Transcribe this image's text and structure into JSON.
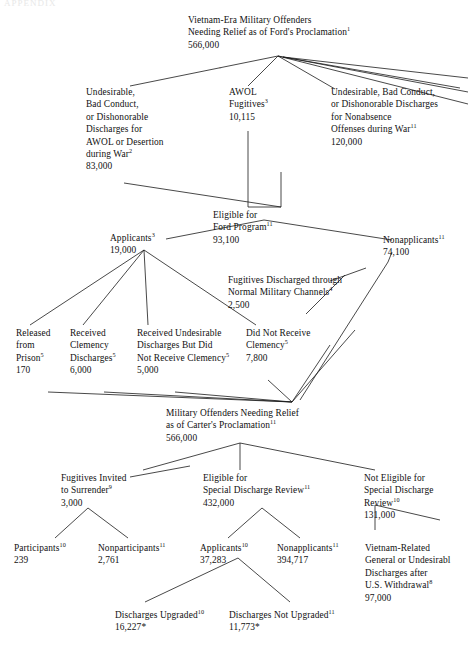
{
  "page": {
    "header_faint": "APPENDIX",
    "background": "#ffffff",
    "ink": "#111111"
  },
  "diagram": {
    "type": "flowchart",
    "nodes": [
      {
        "id": "ford_total",
        "lines": [
          "Vietnam-Era Military Offenders",
          "Needing Relief as of Ford's Proclamation"
        ],
        "sup": "1",
        "value": "566,000"
      },
      {
        "id": "undesirable_awol",
        "lines": [
          "Undesirable,",
          "Bad Conduct,",
          "or Dishonorable",
          "Discharges for",
          "AWOL or Desertion",
          "during War"
        ],
        "sup": "2",
        "value": "83,000"
      },
      {
        "id": "awol_fugitives",
        "lines": [
          "AWOL",
          "Fugitives"
        ],
        "sup": "3",
        "value": "10,115"
      },
      {
        "id": "nonabsence",
        "lines": [
          "Undesirable, Bad Conduct,",
          "or Dishonorable Discharges",
          "for Nonabsence",
          "Offenses during War"
        ],
        "sup": "11",
        "value": "120,000"
      },
      {
        "id": "eligible_ford",
        "lines": [
          "Eligible for",
          "Ford Program"
        ],
        "sup": "11",
        "value": "93,100"
      },
      {
        "id": "applicants_ford",
        "lines": [
          "Applicants"
        ],
        "sup": "3",
        "value": "19,000"
      },
      {
        "id": "nonapplicants_ford",
        "lines": [
          "Nonapplicants"
        ],
        "sup": "11",
        "value": "74,100"
      },
      {
        "id": "fugitives_normal",
        "lines": [
          "Fugitives Discharged through",
          "Normal Military Channels"
        ],
        "sup": "4",
        "value": "2,500"
      },
      {
        "id": "released_prison",
        "lines": [
          "Released",
          "from",
          "Prison"
        ],
        "sup": "5",
        "value": "170"
      },
      {
        "id": "received_clemency",
        "lines": [
          "Received",
          "Clemency",
          "Discharges"
        ],
        "sup": "5",
        "value": "6,000"
      },
      {
        "id": "undesirable_no_clemency",
        "lines": [
          "Received Undesirable",
          "Discharges But Did",
          "Not Receive Clemency"
        ],
        "sup": "5",
        "value": "5,000"
      },
      {
        "id": "did_not_receive",
        "lines": [
          "Did Not Receive",
          "Clemency"
        ],
        "sup": "5",
        "value": "7,800"
      },
      {
        "id": "carter_total",
        "lines": [
          "Military Offenders Needing Relief",
          "as of Carter's Proclamation"
        ],
        "sup": "11",
        "value": "566,000"
      },
      {
        "id": "fugitives_invited",
        "lines": [
          "Fugitives Invited",
          "to Surrender"
        ],
        "sup": "9",
        "value": "3,000"
      },
      {
        "id": "eligible_sdr",
        "lines": [
          "Eligible for",
          "Special Discharge Review"
        ],
        "sup": "11",
        "value": "432,000"
      },
      {
        "id": "not_eligible_sdr",
        "lines": [
          "Not Eligible for",
          "Special Discharge",
          "Review"
        ],
        "sup": "10",
        "value": "131,000"
      },
      {
        "id": "participants",
        "lines": [
          "Participants"
        ],
        "sup": "10",
        "value": "239"
      },
      {
        "id": "nonparticipants",
        "lines": [
          "Nonparticipants"
        ],
        "sup": "11",
        "value": "2,761"
      },
      {
        "id": "applicants_sdr",
        "lines": [
          "Applicants"
        ],
        "sup": "10",
        "value": "37,283"
      },
      {
        "id": "nonapplicants_sdr",
        "lines": [
          "Nonapplicants"
        ],
        "sup": "11",
        "value": "394,717"
      },
      {
        "id": "vietnam_related",
        "lines": [
          "Vietnam-Related",
          "General or Undesirabl",
          "Discharges after",
          "U.S. Withdrawal"
        ],
        "sup": "8",
        "value": "97,000"
      },
      {
        "id": "discharges_upgraded",
        "lines": [
          "Discharges Upgraded"
        ],
        "sup": "10",
        "value": "16,227*"
      },
      {
        "id": "discharges_not_upgraded",
        "lines": [
          "Discharges Not Upgraded"
        ],
        "sup": "11",
        "value": "11,773*"
      }
    ]
  }
}
